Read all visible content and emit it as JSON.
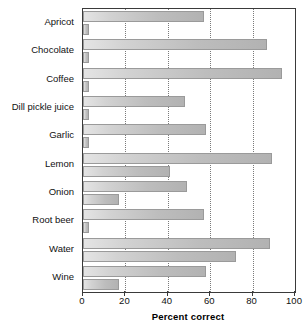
{
  "chart_data": {
    "type": "bar",
    "orientation": "horizontal",
    "title": "",
    "xlabel": "Percent correct",
    "ylabel": "",
    "xlim": [
      0,
      100
    ],
    "xticks": [
      0,
      20,
      40,
      60,
      80,
      100
    ],
    "grid": true,
    "grid_axis": "x",
    "legend": "none",
    "categories": [
      "Apricot",
      "Chocolate",
      "Coffee",
      "Dill pickle juice",
      "Garlic",
      "Lemon",
      "Onion",
      "Root beer",
      "Water",
      "Wine"
    ],
    "series": [
      {
        "name": "Series 1",
        "values": [
          57,
          87,
          94,
          48,
          58,
          89,
          49,
          57,
          88,
          58
        ]
      },
      {
        "name": "Series 2",
        "values": [
          3,
          3,
          3,
          3,
          3,
          41,
          17,
          3,
          72,
          17
        ]
      }
    ],
    "bar_fill_light": "#e4e4e4",
    "bar_fill_dark": "#b2b2b2",
    "bar_edge_color": "#9a9a9a",
    "frame_color": "#3a3a3a",
    "gridline_color": "#7a7a7a",
    "background_color": "#ffffff",
    "text_color": "#111111"
  }
}
